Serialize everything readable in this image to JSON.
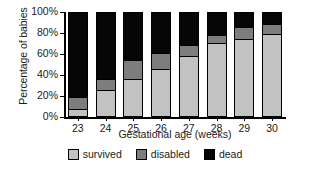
{
  "chart_data": {
    "type": "bar",
    "subtype": "stacked-percentage",
    "title": "",
    "xlabel": "Gestational age (weeks)",
    "ylabel": "Percentage of babies",
    "categories": [
      "23",
      "24",
      "25",
      "26",
      "27",
      "28",
      "29",
      "30"
    ],
    "ylim": [
      0,
      100
    ],
    "ytick_labels": [
      "0%",
      "20%",
      "40%",
      "60%",
      "80%",
      "100%"
    ],
    "ytick_values": [
      0,
      20,
      40,
      60,
      80,
      100
    ],
    "grid": false,
    "legend_position": "bottom",
    "series": [
      {
        "name": "survived",
        "color": "#c2c2c2",
        "values": [
          6,
          24,
          35,
          45,
          57,
          70,
          74,
          79
        ]
      },
      {
        "name": "disabled",
        "color": "#7d7d7d",
        "values": [
          12,
          12,
          19,
          16,
          12,
          9,
          12,
          10
        ]
      },
      {
        "name": "dead",
        "color": "#060606",
        "values": [
          82,
          64,
          46,
          39,
          31,
          21,
          14,
          11
        ]
      }
    ]
  },
  "legend": {
    "items": [
      {
        "label": "survived",
        "color": "#c2c2c2"
      },
      {
        "label": "disabled",
        "color": "#7d7d7d"
      },
      {
        "label": "dead",
        "color": "#060606"
      }
    ]
  }
}
